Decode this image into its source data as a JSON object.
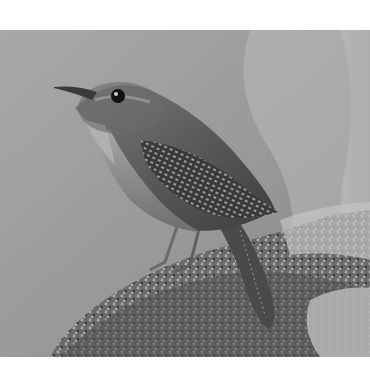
{
  "image": {
    "subject": "wren perched on branch",
    "style": "grayscale photograph",
    "colors": {
      "background_light": "#b5b5b5",
      "background_dark": "#8a8a8a",
      "bird_body": "#5a5a5a",
      "bird_belly": "#8c8c8c",
      "branch_dark": "#3a3a3a",
      "branch_light": "#c8c8c8",
      "border": "#ffffff"
    }
  }
}
